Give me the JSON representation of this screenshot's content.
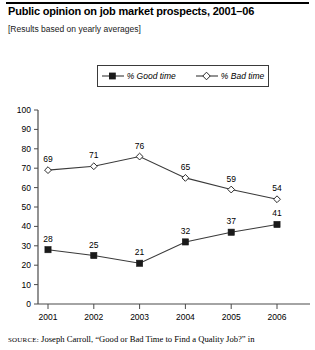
{
  "header": {
    "title": "Public opinion on job market prospects, 2001–06",
    "subtitle": "[Results based on yearly averages]"
  },
  "legend": {
    "good_label": "% Good time",
    "bad_label": "% Bad time"
  },
  "source": {
    "kicker": "SOURCE:",
    "text": " Joseph Carroll, “Good or Bad Time to Find a Quality Job?” in"
  },
  "axis": {
    "y_ticks": [
      "100",
      "90",
      "80",
      "70",
      "60",
      "50",
      "40",
      "30",
      "20",
      "10",
      "0"
    ],
    "x_ticks": [
      "2001",
      "2002",
      "2003",
      "2004",
      "2005",
      "2006"
    ]
  },
  "colors": {
    "line": "#3a3a3a",
    "axis": "#4a4a4a",
    "text": "#000000",
    "marker_good_fill": "#1a1a1a",
    "marker_bad_fill": "#ffffff"
  },
  "chart_data": {
    "type": "line",
    "title": "Public opinion on job market prospects, 2001–06",
    "subtitle": "[Results based on yearly averages]",
    "xlabel": "",
    "ylabel": "",
    "ylim": [
      0,
      100
    ],
    "ytick_step": 10,
    "grid": false,
    "legend_position": "top-center",
    "categories": [
      "2001",
      "2002",
      "2003",
      "2004",
      "2005",
      "2006"
    ],
    "series": [
      {
        "name": "% Good time",
        "marker": "filled-square",
        "values": [
          28,
          25,
          21,
          32,
          37,
          41
        ]
      },
      {
        "name": "% Bad time",
        "marker": "hollow-diamond",
        "values": [
          69,
          71,
          76,
          65,
          59,
          54
        ]
      }
    ]
  }
}
